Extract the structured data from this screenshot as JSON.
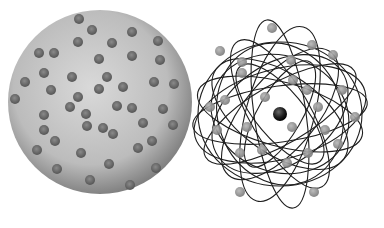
{
  "figure": {
    "background": "#ffffff"
  },
  "left_model": {
    "name": "plum-pudding-sphere",
    "center": [
      100,
      102
    ],
    "radius": 92,
    "fill_center": "#d8d8d8",
    "fill_edge": "#8a8a8a",
    "electron_radius": 5,
    "electron_color": "#6a6a6a",
    "electrons": [
      [
        79,
        19
      ],
      [
        92,
        30
      ],
      [
        132,
        32
      ],
      [
        78,
        42
      ],
      [
        112,
        43
      ],
      [
        158,
        41
      ],
      [
        39,
        53
      ],
      [
        54,
        53
      ],
      [
        99,
        59
      ],
      [
        132,
        56
      ],
      [
        160,
        60
      ],
      [
        44,
        73
      ],
      [
        25,
        82
      ],
      [
        72,
        77
      ],
      [
        107,
        77
      ],
      [
        154,
        82
      ],
      [
        174,
        84
      ],
      [
        51,
        90
      ],
      [
        99,
        89
      ],
      [
        123,
        87
      ],
      [
        15,
        99
      ],
      [
        78,
        97
      ],
      [
        70,
        107
      ],
      [
        117,
        106
      ],
      [
        132,
        108
      ],
      [
        163,
        109
      ],
      [
        44,
        115
      ],
      [
        86,
        114
      ],
      [
        44,
        130
      ],
      [
        87,
        126
      ],
      [
        103,
        128
      ],
      [
        143,
        123
      ],
      [
        113,
        134
      ],
      [
        173,
        125
      ],
      [
        55,
        141
      ],
      [
        37,
        150
      ],
      [
        152,
        141
      ],
      [
        138,
        148
      ],
      [
        81,
        153
      ],
      [
        109,
        164
      ],
      [
        57,
        169
      ],
      [
        156,
        168
      ],
      [
        90,
        180
      ],
      [
        130,
        185
      ]
    ]
  },
  "right_model": {
    "name": "nuclear-atom",
    "nucleus": {
      "center": [
        280,
        114
      ],
      "radius": 7,
      "color": "#1a1a1a"
    },
    "orbit_color": "#1e1e1e",
    "orbits": [
      {
        "rx": 82,
        "ry": 72,
        "rot": 0
      },
      {
        "rx": 88,
        "ry": 28,
        "rot": -8
      },
      {
        "rx": 85,
        "ry": 32,
        "rot": 15
      },
      {
        "rx": 78,
        "ry": 40,
        "rot": 35
      },
      {
        "rx": 84,
        "ry": 30,
        "rot": 60
      },
      {
        "rx": 95,
        "ry": 26,
        "rot": 82
      },
      {
        "rx": 90,
        "ry": 34,
        "rot": 105
      },
      {
        "rx": 80,
        "ry": 36,
        "rot": 130
      },
      {
        "rx": 86,
        "ry": 30,
        "rot": 150
      },
      {
        "rx": 70,
        "ry": 58,
        "rot": 20
      },
      {
        "rx": 75,
        "ry": 50,
        "rot": -35
      },
      {
        "rx": 62,
        "ry": 24,
        "rot": 50
      },
      {
        "rx": 60,
        "ry": 22,
        "rot": -60
      },
      {
        "rx": 88,
        "ry": 45,
        "rot": -15
      },
      {
        "rx": 72,
        "ry": 62,
        "rot": 70
      }
    ],
    "electron_radius": 5,
    "electron_color": "#8c8c8c",
    "electrons": [
      [
        272,
        28
      ],
      [
        220,
        51
      ],
      [
        312,
        45
      ],
      [
        333,
        55
      ],
      [
        242,
        62
      ],
      [
        291,
        60
      ],
      [
        242,
        73
      ],
      [
        225,
        100
      ],
      [
        293,
        80
      ],
      [
        307,
        90
      ],
      [
        342,
        90
      ],
      [
        210,
        107
      ],
      [
        265,
        97
      ],
      [
        318,
        107
      ],
      [
        355,
        117
      ],
      [
        217,
        130
      ],
      [
        247,
        127
      ],
      [
        292,
        127
      ],
      [
        325,
        130
      ],
      [
        338,
        144
      ],
      [
        262,
        150
      ],
      [
        287,
        163
      ],
      [
        308,
        153
      ],
      [
        240,
        153
      ],
      [
        240,
        192
      ],
      [
        314,
        192
      ]
    ]
  }
}
